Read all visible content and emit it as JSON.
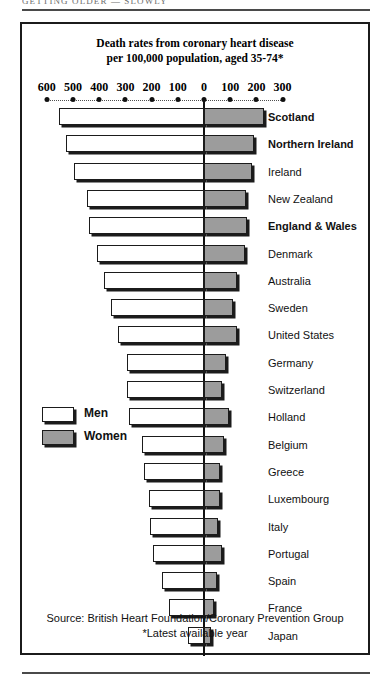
{
  "page": {
    "running_head": "GETTING OLDER — SLOWLY"
  },
  "figure": {
    "title_line1": "Death rates from coronary heart disease",
    "title_line2": "per 100,000 population, aged 35-74*",
    "source_line1": "Source: British Heart Foundation/Coronary Prevention Group",
    "source_line2": "*Latest available year"
  },
  "legend": {
    "items": [
      {
        "label": "Men",
        "swatch": "men",
        "color": "#ffffff"
      },
      {
        "label": "Women",
        "swatch": "women",
        "color": "#9c9c9c"
      }
    ]
  },
  "chart_data": {
    "type": "bar",
    "orientation": "horizontal-diverging",
    "title": "Death rates from coronary heart disease per 100,000 population, aged 35-74*",
    "xlabel": "",
    "ylabel": "",
    "grid": false,
    "legend_position": "inside-left",
    "axis": {
      "tick_labels": [
        "600",
        "500",
        "400",
        "300",
        "200",
        "100",
        "0",
        "100",
        "200",
        "300"
      ],
      "tick_values": [
        -600,
        -500,
        -400,
        -300,
        -200,
        -100,
        0,
        100,
        200,
        300
      ],
      "left_max": 600,
      "right_max": 300,
      "left_series": "Men",
      "right_series": "Women"
    },
    "categories": [
      "Scotland",
      "Northern Ireland",
      "Ireland",
      "New Zealand",
      "England & Wales",
      "Denmark",
      "Australia",
      "Sweden",
      "United States",
      "Germany",
      "Switzerland",
      "Holland",
      "Belgium",
      "Greece",
      "Luxembourg",
      "Italy",
      "Portugal",
      "Spain",
      "France",
      "Japan"
    ],
    "highlighted": [
      "Scotland",
      "Northern Ireland",
      "England & Wales"
    ],
    "series": [
      {
        "name": "Men",
        "color": "#ffffff",
        "values": [
          555,
          525,
          495,
          445,
          440,
          410,
          380,
          355,
          330,
          295,
          295,
          285,
          235,
          230,
          210,
          205,
          195,
          160,
          135,
          60
        ]
      },
      {
        "name": "Women",
        "color": "#9c9c9c",
        "values": [
          230,
          190,
          185,
          160,
          165,
          155,
          125,
          110,
          125,
          85,
          70,
          95,
          75,
          60,
          60,
          55,
          70,
          50,
          40,
          25
        ]
      }
    ]
  }
}
